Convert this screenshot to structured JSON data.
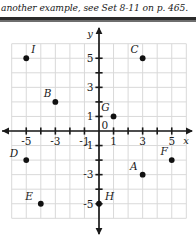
{
  "caption": {
    "text": "another example, see Set 8-11 on p. 465."
  },
  "graph": {
    "x_axis_label": "x",
    "y_axis_label": "y",
    "x_tick_labels": [
      "-5",
      "-3",
      "-1",
      "1",
      "3",
      "5"
    ],
    "y_tick_labels": [
      "5",
      "3",
      "1",
      "-1",
      "-3",
      "-5"
    ],
    "origin_label": "0",
    "colors": {
      "grid": "#d9d9d9",
      "axis": "#1a1a1a",
      "point": "#111111",
      "text": "#1a1a1a",
      "background": "#ffffff"
    }
  },
  "chart_data": {
    "type": "scatter",
    "title": "",
    "xlabel": "x",
    "ylabel": "y",
    "xlim": [
      -6,
      6
    ],
    "ylim": [
      -6,
      6
    ],
    "grid": true,
    "legend": "none",
    "x_ticks": [
      -5,
      -3,
      -1,
      1,
      3,
      5
    ],
    "y_ticks": [
      5,
      3,
      1,
      -1,
      -3,
      -5
    ],
    "points": [
      {
        "label": "I",
        "x": -5,
        "y": 5
      },
      {
        "label": "C",
        "x": 3,
        "y": 5
      },
      {
        "label": "B",
        "x": -3,
        "y": 2
      },
      {
        "label": "G",
        "x": 1,
        "y": 1
      },
      {
        "label": "D",
        "x": -5,
        "y": -2
      },
      {
        "label": "F",
        "x": 5,
        "y": -2
      },
      {
        "label": "A",
        "x": 3,
        "y": -3
      },
      {
        "label": "E",
        "x": -4,
        "y": -5
      },
      {
        "label": "H",
        "x": 0,
        "y": -5
      }
    ]
  }
}
